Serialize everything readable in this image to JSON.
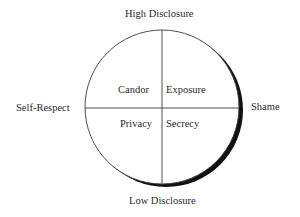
{
  "diagram": {
    "axes": {
      "top": "High Disclosure",
      "bottom": "Low Disclosure",
      "left": "Self-Respect",
      "right": "Shame"
    },
    "quadrants": {
      "top_left": "Candor",
      "top_right": "Exposure",
      "bottom_left": "Privacy",
      "bottom_right": "Secrecy"
    },
    "colors": {
      "line": "#3a3a3a",
      "shadow": "#111111",
      "background": "#ffffff"
    }
  }
}
